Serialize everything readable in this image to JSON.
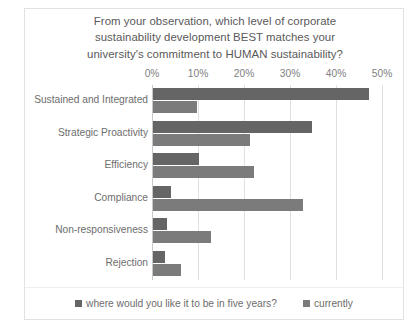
{
  "chart_data": {
    "type": "bar",
    "orientation": "horizontal",
    "title": "From your observation, which level of corporate sustainability development BEST matches your university's commitment to HUMAN sustainability?",
    "title_lines": [
      "From your observation, which level of corporate",
      "sustainability development BEST matches your",
      "university's commitment to HUMAN sustainability?"
    ],
    "categories": [
      "Sustained and Integrated",
      "Strategic Proactivity",
      "Efficiency",
      "Compliance",
      "Non-responsiveness",
      "Rejection"
    ],
    "series": [
      {
        "name": "where would you like it to be in five years?",
        "color": "#656565",
        "values": [
          47,
          34.5,
          10,
          4,
          3,
          2.5
        ]
      },
      {
        "name": "currently",
        "color": "#7b7b7b",
        "values": [
          9.5,
          21,
          22,
          32.5,
          12.5,
          6
        ]
      }
    ],
    "xlabel": "",
    "ylabel": "",
    "xlim": [
      0,
      50
    ],
    "xticks": [
      0,
      10,
      20,
      30,
      40,
      50
    ],
    "xtick_labels": [
      "0%",
      "10%",
      "20%",
      "30%",
      "40%",
      "50%"
    ],
    "grid": "vertical",
    "legend_position": "bottom"
  },
  "legend": {
    "items": [
      {
        "label": "where would you like it to be in five years?",
        "color": "#656565"
      },
      {
        "label": "currently",
        "color": "#7b7b7b"
      }
    ]
  }
}
